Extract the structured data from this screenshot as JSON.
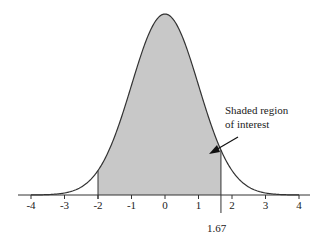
{
  "chart_data": {
    "type": "area",
    "title": "",
    "xlabel": "",
    "ylabel": "",
    "distribution": "standard normal",
    "xlim": [
      -4,
      4
    ],
    "x_ticks": [
      -4,
      -3,
      -2,
      -1,
      0,
      1,
      2,
      3,
      4
    ],
    "x_tick_labels": [
      "-4",
      "-3",
      "-2",
      "-1",
      "0",
      "1",
      "2",
      "3",
      "4"
    ],
    "shaded_region": {
      "from": -2,
      "to": 1.67,
      "color": "#c8c8c8"
    },
    "marker": {
      "x": 1.67,
      "label": "1.67"
    },
    "annotation": {
      "text_line1": "Shaded region",
      "text_line2": "of interest"
    },
    "grid": false,
    "legend": null
  }
}
